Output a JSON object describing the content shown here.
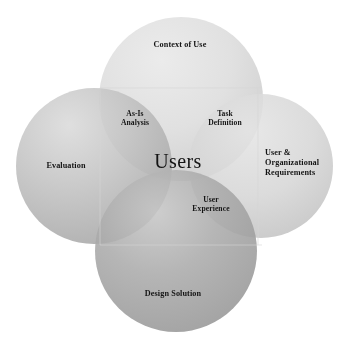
{
  "diagram": {
    "background_color": "#ffffff",
    "text_color": "#141414",
    "center": {
      "id": "users",
      "label": "Users"
    },
    "circles": [
      {
        "id": "context-of-use",
        "position": "top",
        "label": "Context of Use",
        "fill_color": "#d9d9d9",
        "cx": 181,
        "cy": 99,
        "r": 82
      },
      {
        "id": "evaluation",
        "position": "left",
        "label": "Evaluation",
        "fill_color": "#b9b9b9",
        "cx": 94,
        "cy": 166,
        "r": 78
      },
      {
        "id": "user-organizational-requirements",
        "position": "right",
        "label_lines": [
          "User &",
          "Organizational",
          "Requirements"
        ],
        "fill_color": "#d2d2d2",
        "cx": 261,
        "cy": 166,
        "r": 72
      },
      {
        "id": "design-solution",
        "position": "bottom",
        "label": "Design Solution",
        "fill_color": "#a8a8a8",
        "cx": 176,
        "cy": 251,
        "r": 81
      }
    ],
    "intersections": [
      {
        "id": "as-is-analysis",
        "between": [
          "context-of-use",
          "evaluation"
        ],
        "label_lines": [
          "As-Is",
          "Analysis"
        ]
      },
      {
        "id": "task-definition",
        "between": [
          "context-of-use",
          "user-organizational-requirements"
        ],
        "label_lines": [
          "Task",
          "Definition"
        ]
      },
      {
        "id": "user-experience",
        "between": [
          "design-solution",
          "user-organizational-requirements"
        ],
        "label_lines": [
          "User",
          "Experience"
        ]
      }
    ]
  }
}
